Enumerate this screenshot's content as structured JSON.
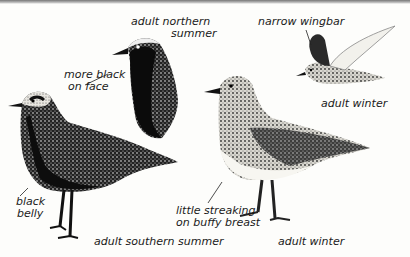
{
  "plate": {
    "labels": {
      "northern_summer_line1": "adult northern",
      "northern_summer_line2": "summer",
      "more_black_line1": "more black",
      "more_black_line2": "on face",
      "narrow_wingbar": "narrow wingbar",
      "flight_winter": "adult winter",
      "black_belly_line1": "black",
      "black_belly_line2": "belly",
      "streaking_line1": "little streaking",
      "streaking_line2": "on buffy breast",
      "southern_summer": "adult southern summer",
      "standing_winter": "adult winter"
    },
    "colors": {
      "ink": "#111111",
      "paper": "#fdfdfb",
      "mid": "#9a9a94"
    }
  }
}
